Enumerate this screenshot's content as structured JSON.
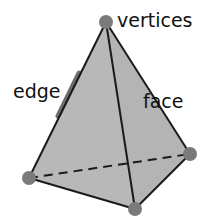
{
  "diagram": {
    "labels": {
      "vertices": "vertices",
      "edge": "edge",
      "face": "face"
    },
    "colors": {
      "face_fill": "#b8b8b8",
      "edge_stroke": "#1a1a1a",
      "vertex_fill": "#7a7a7a",
      "edge_highlight": "#6e6e6e",
      "text": "#111111"
    },
    "vertices": [
      {
        "name": "top",
        "x": 106,
        "y": 22
      },
      {
        "name": "left",
        "x": 29,
        "y": 178
      },
      {
        "name": "bottom",
        "x": 135,
        "y": 209
      },
      {
        "name": "right",
        "x": 190,
        "y": 154
      }
    ]
  }
}
